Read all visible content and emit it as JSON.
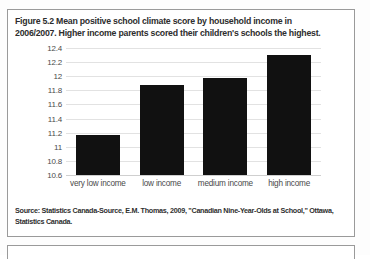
{
  "figure": {
    "caption": "Figure 5.2 Mean positive school climate score by household income in 2006/2007. Higher income parents scored their children's schools the highest.",
    "source": "Source: Statistics Canada-Source, E.M. Thomas, 2009, \"Canadian Nine-Year-Olds at School,\" Ottawa, Statistics Canada."
  },
  "chart_data": {
    "type": "bar",
    "title": "Mean positive school climate score by household income in 2006/2007",
    "categories": [
      "very low income",
      "low income",
      "medium income",
      "high income"
    ],
    "values": [
      11.17,
      11.87,
      11.97,
      12.3
    ],
    "xlabel": "",
    "ylabel": "",
    "ylim": [
      10.6,
      12.4
    ],
    "yticks": [
      "10.6",
      "10.8",
      "11",
      "11.2",
      "11.4",
      "11.6",
      "11.8",
      "12",
      "12.2",
      "12.4"
    ],
    "ytick_values": [
      10.6,
      10.8,
      11,
      11.2,
      11.4,
      11.6,
      11.8,
      12,
      12.2,
      12.4
    ],
    "grid": true,
    "legend": false,
    "bar_color": "#111111",
    "grid_color": "#e2e2e2"
  }
}
